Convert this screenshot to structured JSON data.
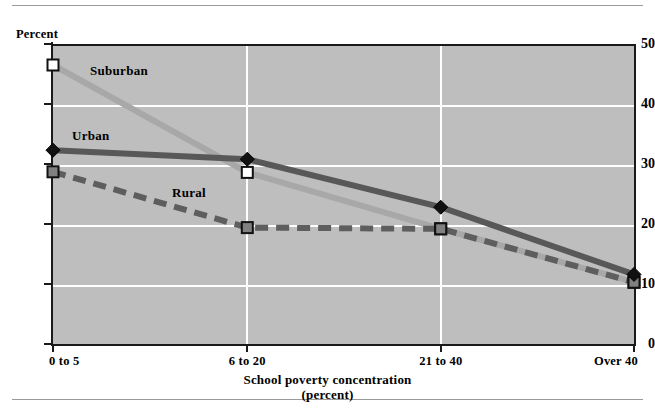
{
  "figure": {
    "y_axis_caption": "Percent",
    "x_axis_title_line1": "School poverty concentration",
    "x_axis_title_line2": "(percent)"
  },
  "chart_data": {
    "type": "line",
    "title": "",
    "xlabel": "School poverty concentration (percent)",
    "ylabel": "Percent",
    "categories": [
      "0 to 5",
      "6 to 20",
      "21 to 40",
      "Over 40"
    ],
    "ylim": [
      0,
      50
    ],
    "yticks": [
      0,
      10,
      20,
      30,
      40,
      50
    ],
    "grid": "horizontal and vertical white gridlines",
    "legend": "inline series labels",
    "series": [
      {
        "name": "Suburban",
        "values": [
          46.5,
          28.6,
          19.2,
          10.3
        ],
        "color": "#a8a8a8",
        "style": "solid",
        "marker": "open-square"
      },
      {
        "name": "Urban",
        "values": [
          32.3,
          30.8,
          22.8,
          11.6
        ],
        "color": "#585858",
        "style": "solid",
        "marker": "filled-diamond"
      },
      {
        "name": "Rural",
        "values": [
          28.7,
          19.4,
          19.2,
          10.3
        ],
        "color": "#5e5e5e",
        "style": "dashed",
        "marker": "filled-square"
      }
    ]
  },
  "colors": {
    "plot_background": "#bebebe",
    "gridline": "#ffffff",
    "axis": "#1a1a1a",
    "suburban": "#a8a8a8",
    "urban": "#585858",
    "rural": "#5e5e5e"
  }
}
